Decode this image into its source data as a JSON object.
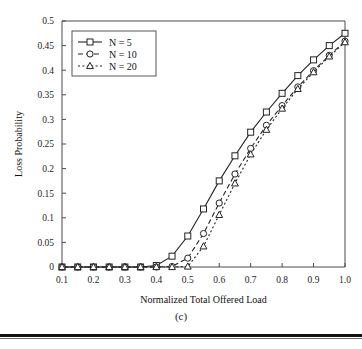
{
  "figure": {
    "caption": "(c)"
  },
  "chart_data": {
    "type": "line",
    "title": "",
    "xlabel": "Normalized Total Offered Load",
    "ylabel": "Loss Probability",
    "xlim": [
      0.1,
      1.0
    ],
    "ylim": [
      0,
      0.5
    ],
    "grid": false,
    "legend_position": "top-left",
    "xticks": [
      "0.1",
      "0.2",
      "0.3",
      "0.4",
      "0.5",
      "0.6",
      "0.7",
      "0.8",
      "0.9",
      "1.0"
    ],
    "xtick_values": [
      0.1,
      0.2,
      0.3,
      0.4,
      0.5,
      0.6,
      0.7,
      0.8,
      0.9,
      1.0
    ],
    "yticks": [
      "0",
      "0.05",
      "0.1",
      "0.15",
      "0.2",
      "0.25",
      "0.3",
      "0.35",
      "0.4",
      "0.45",
      "0.5"
    ],
    "ytick_values": [
      0,
      0.05,
      0.1,
      0.15,
      0.2,
      0.25,
      0.3,
      0.35,
      0.4,
      0.45,
      0.5
    ],
    "x": [
      0.1,
      0.15,
      0.2,
      0.25,
      0.3,
      0.35,
      0.4,
      0.45,
      0.5,
      0.55,
      0.6,
      0.65,
      0.7,
      0.75,
      0.8,
      0.85,
      0.9,
      0.95,
      1.0
    ],
    "series": [
      {
        "name": "N = 5",
        "marker": "square",
        "linestyle": "solid",
        "color": "#232323",
        "values": [
          0.0,
          0.0,
          0.0,
          0.0,
          0.0,
          0.0,
          0.003,
          0.022,
          0.063,
          0.118,
          0.175,
          0.226,
          0.274,
          0.315,
          0.353,
          0.389,
          0.421,
          0.45,
          0.475
        ]
      },
      {
        "name": "N = 10",
        "marker": "circle",
        "linestyle": "dashed",
        "color": "#232323",
        "values": [
          0.0,
          0.0,
          0.0,
          0.0,
          0.0,
          0.0,
          0.0,
          0.001,
          0.018,
          0.068,
          0.13,
          0.189,
          0.241,
          0.288,
          0.328,
          0.366,
          0.399,
          0.43,
          0.459
        ]
      },
      {
        "name": "N = 20",
        "marker": "triangle",
        "linestyle": "dotted",
        "color": "#232323",
        "values": [
          0.0,
          0.0,
          0.0,
          0.0,
          0.0,
          0.0,
          0.0,
          0.0,
          0.001,
          0.042,
          0.106,
          0.17,
          0.229,
          0.279,
          0.322,
          0.362,
          0.396,
          0.428,
          0.457
        ]
      }
    ]
  }
}
